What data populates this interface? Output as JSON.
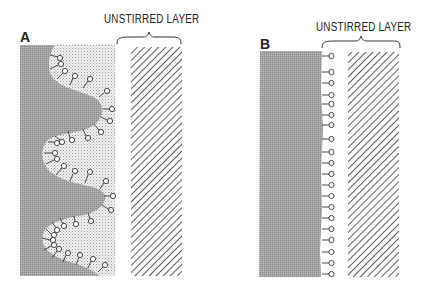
{
  "panels": [
    {
      "label": "A",
      "unstirred_layer_label": "UNSTIRRED LAYER",
      "membrane": "folded (villous)",
      "shading": {
        "cell": "#9a9a9a",
        "stippled_region": "#d8d8d8",
        "hatch": "#333333"
      }
    },
    {
      "label": "B",
      "unstirred_layer_label": "UNSTIRRED LAYER",
      "membrane": "flat",
      "shading": {
        "cell": "#a8a8a8",
        "hatch": "#333333"
      }
    }
  ]
}
